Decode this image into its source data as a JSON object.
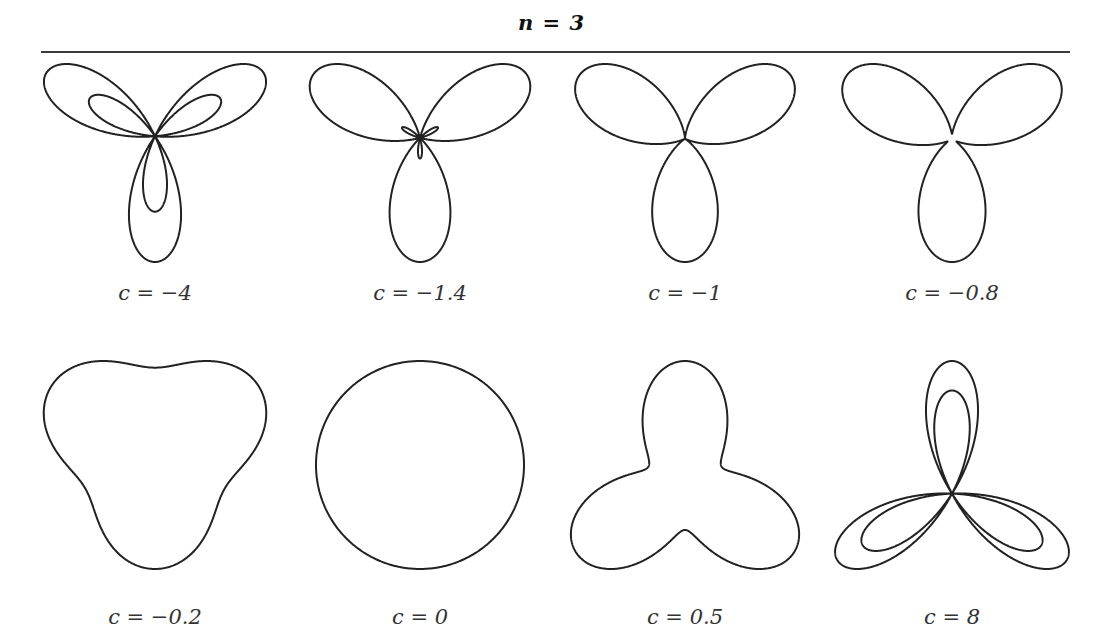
{
  "figure": {
    "title": "n = 3",
    "line_color": "#222222",
    "background": "#ffffff"
  },
  "chart_data": {
    "type": "polar-curve-grid",
    "title": "n = 3",
    "layout": {
      "rows": 2,
      "cols": 4,
      "grid": false,
      "axes": false
    },
    "panels": [
      {
        "label": "c = −4",
        "c": -4,
        "row": 0,
        "col": 0,
        "shape": "three-leaf rose with inner loops (petals up, lower-left, lower-right)"
      },
      {
        "label": "c = −1.4",
        "c": -1.4,
        "row": 0,
        "col": 1,
        "shape": "three-leaf rose with tiny inner loops at center"
      },
      {
        "label": "c = −1",
        "c": -1,
        "row": 0,
        "col": 2,
        "shape": "three-leaf rose meeting at single center point"
      },
      {
        "label": "c = −0.8",
        "c": -0.8,
        "row": 0,
        "col": 3,
        "shape": "three-lobed curve, lobes joined, cusps near center"
      },
      {
        "label": "c = −0.2",
        "c": -0.2,
        "row": 1,
        "col": 0,
        "shape": "rounded triangle, pointing up"
      },
      {
        "label": "c = 0",
        "c": 0,
        "row": 1,
        "col": 1,
        "shape": "circle"
      },
      {
        "label": "c = 0.5",
        "c": 0.5,
        "row": 1,
        "col": 2,
        "shape": "three-lobed curve, lobes up-left, up-right, down"
      },
      {
        "label": "c = 8",
        "c": 8,
        "row": 1,
        "col": 3,
        "shape": "three-leaf rose with inner loops (petals down, upper-left, upper-right)"
      }
    ]
  }
}
